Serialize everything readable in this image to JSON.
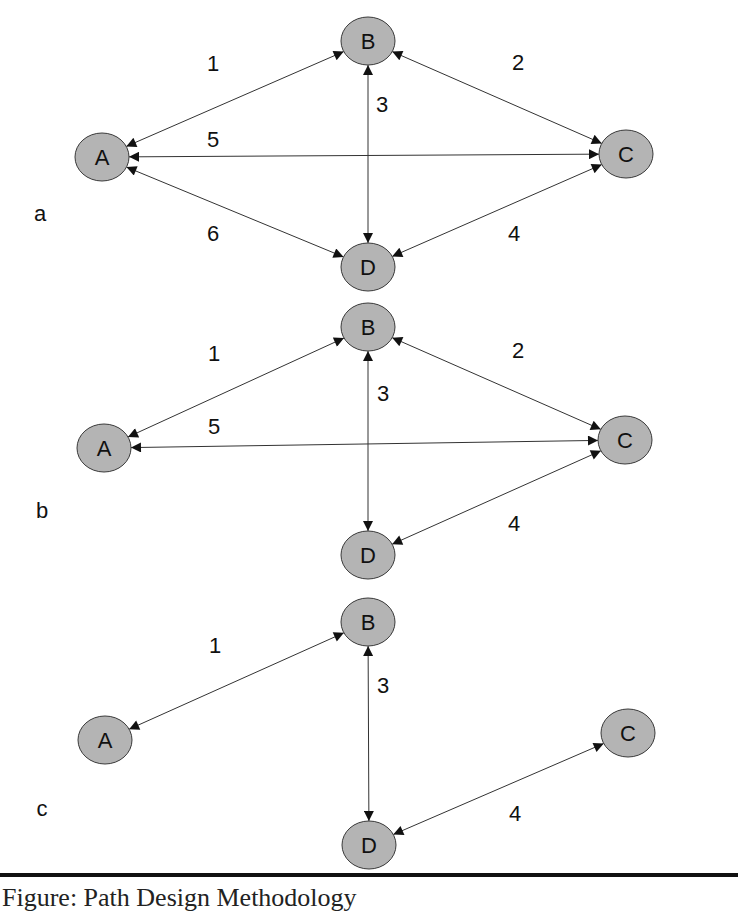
{
  "caption": "Figure: Path Design Methodology",
  "colors": {
    "node_fill": "#b4b4b4",
    "node_stroke": "#3a3a3a",
    "edge": "#333333",
    "text": "#111111"
  },
  "panels": [
    {
      "label": "a",
      "label_pos": [
        40,
        213
      ],
      "nodes": [
        {
          "id": "A",
          "x": 102,
          "y": 157
        },
        {
          "id": "B",
          "x": 368,
          "y": 41
        },
        {
          "id": "C",
          "x": 626,
          "y": 154
        },
        {
          "id": "D",
          "x": 368,
          "y": 267
        }
      ],
      "edges": [
        {
          "label": "1",
          "from": "A",
          "to": "B",
          "label_pos": [
            213,
            63
          ]
        },
        {
          "label": "2",
          "from": "B",
          "to": "C",
          "label_pos": [
            518,
            62
          ]
        },
        {
          "label": "3",
          "from": "B",
          "to": "D",
          "label_pos": [
            382,
            104
          ]
        },
        {
          "label": "4",
          "from": "C",
          "to": "D",
          "label_pos": [
            514,
            233
          ]
        },
        {
          "label": "5",
          "from": "A",
          "to": "C",
          "label_pos": [
            213,
            139
          ]
        },
        {
          "label": "6",
          "from": "A",
          "to": "D",
          "label_pos": [
            213,
            233
          ]
        }
      ]
    },
    {
      "label": "b",
      "label_pos": [
        42,
        510
      ],
      "nodes": [
        {
          "id": "A",
          "x": 104,
          "y": 448
        },
        {
          "id": "B",
          "x": 368,
          "y": 327
        },
        {
          "id": "C",
          "x": 625,
          "y": 440
        },
        {
          "id": "D",
          "x": 368,
          "y": 555
        }
      ],
      "edges": [
        {
          "label": "1",
          "from": "A",
          "to": "B",
          "label_pos": [
            214,
            353
          ]
        },
        {
          "label": "2",
          "from": "B",
          "to": "C",
          "label_pos": [
            518,
            350
          ]
        },
        {
          "label": "3",
          "from": "B",
          "to": "D",
          "label_pos": [
            383,
            393
          ]
        },
        {
          "label": "4",
          "from": "C",
          "to": "D",
          "label_pos": [
            514,
            523
          ]
        },
        {
          "label": "5",
          "from": "A",
          "to": "C",
          "label_pos": [
            214,
            426
          ]
        }
      ]
    },
    {
      "label": "c",
      "label_pos": [
        42,
        808
      ],
      "nodes": [
        {
          "id": "A",
          "x": 105,
          "y": 740
        },
        {
          "id": "B",
          "x": 368,
          "y": 622
        },
        {
          "id": "C",
          "x": 628,
          "y": 733
        },
        {
          "id": "D",
          "x": 369,
          "y": 845
        }
      ],
      "edges": [
        {
          "label": "1",
          "from": "A",
          "to": "B",
          "label_pos": [
            215,
            645
          ]
        },
        {
          "label": "3",
          "from": "B",
          "to": "D",
          "label_pos": [
            383,
            685
          ]
        },
        {
          "label": "4",
          "from": "C",
          "to": "D",
          "label_pos": [
            515,
            813
          ]
        }
      ]
    }
  ]
}
